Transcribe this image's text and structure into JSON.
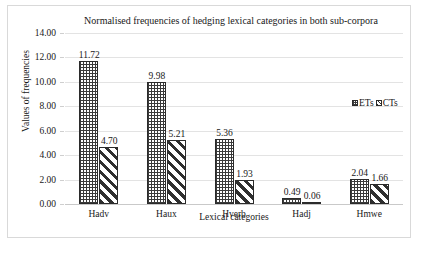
{
  "chart_data": {
    "type": "bar",
    "title": "Normalised frequencies of hedging lexical categories in both sub-corpora",
    "xlabel": "Lexical categories",
    "ylabel": "Values of frequencies",
    "categories": [
      "Hadv",
      "Haux",
      "Hverb",
      "Hadj",
      "Hmwe"
    ],
    "series": [
      {
        "name": "ETs",
        "values": [
          11.72,
          9.98,
          5.36,
          0.49,
          2.04
        ],
        "labels": [
          "11.72",
          "9.98",
          "5.36",
          "0.49",
          "2.04"
        ],
        "pattern": "grid",
        "color": "#3a3a3a"
      },
      {
        "name": "CTs",
        "values": [
          4.7,
          5.21,
          1.93,
          0.06,
          1.66
        ],
        "labels": [
          "4.70",
          "5.21",
          "1.93",
          "0.06",
          "1.66"
        ],
        "pattern": "diagonal-stripes",
        "color": "#2f2f2f"
      }
    ],
    "ylim": [
      0,
      14
    ],
    "ytick_step": 2,
    "ytick_labels": [
      "14.00",
      "12.00",
      "10.00",
      "8.00",
      "6.00",
      "4.00",
      "2.00",
      "0.00"
    ],
    "grid": true,
    "legend_position": "right-middle",
    "data_labels_shown": true
  },
  "legend": {
    "items": [
      {
        "label": "ETs"
      },
      {
        "label": "CTs"
      }
    ]
  }
}
